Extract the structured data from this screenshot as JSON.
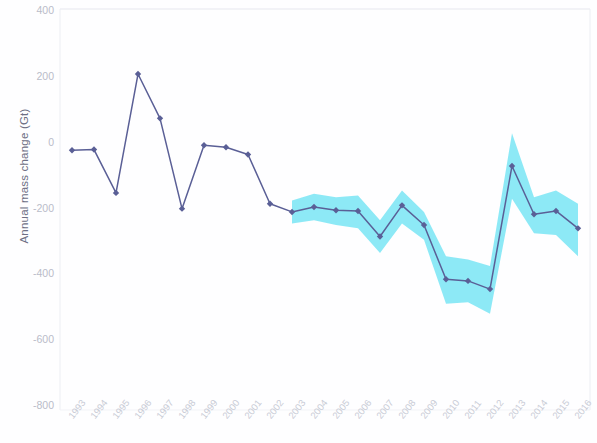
{
  "chart_data": {
    "type": "line",
    "title": "",
    "subtitle": "",
    "xlabel": "",
    "ylabel": "Annual mass change (Gt)",
    "grid": false,
    "legend": "none",
    "categories": [
      "1993",
      "1994",
      "1995",
      "1996",
      "1997",
      "1998",
      "1999",
      "2000",
      "2001",
      "2002",
      "2003",
      "2004",
      "2005",
      "2006",
      "2007",
      "2008",
      "2009",
      "2010",
      "2011",
      "2012",
      "2013",
      "2014",
      "2015",
      "2016"
    ],
    "xlim": [
      "1993",
      "2016"
    ],
    "ylim": [
      -800,
      400
    ],
    "ytick_labels": [
      "400",
      "200",
      "0",
      "-200",
      "-400",
      "-600",
      "-800"
    ],
    "ytick_values": [
      400,
      200,
      0,
      -200,
      -400,
      -600,
      -800
    ],
    "series": [
      {
        "name": "Annual mass change",
        "color": "#5a5f96",
        "marker": "diamond",
        "values": [
          -27,
          -25,
          -157,
          205,
          70,
          -205,
          -12,
          -18,
          -40,
          -190,
          -215,
          -200,
          -210,
          -212,
          -290,
          -195,
          -255,
          -420,
          -425,
          -450,
          -75,
          -222,
          -212,
          -265
        ]
      }
    ],
    "uncertainty_band": {
      "label": "uncertainty range",
      "color": "#79e5f4",
      "start_year": "2003",
      "end_year": "2016",
      "upper": [
        -180,
        -160,
        -170,
        -165,
        -240,
        -150,
        -215,
        -350,
        -360,
        -380,
        25,
        -170,
        -150,
        -190
      ],
      "lower": [
        -250,
        -240,
        -255,
        -265,
        -340,
        -250,
        -300,
        -495,
        -490,
        -525,
        -175,
        -280,
        -285,
        -350
      ]
    }
  },
  "axes": {
    "y_title": "Annual mass change (Gt)"
  }
}
